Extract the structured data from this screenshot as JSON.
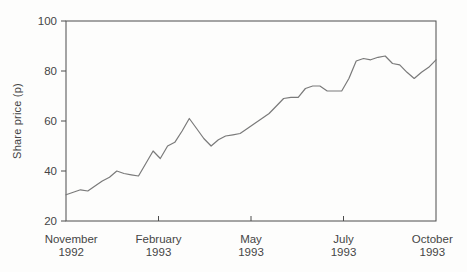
{
  "chart_data": {
    "type": "line",
    "title": "",
    "ylabel": "Share price (p)",
    "xlabel": "",
    "ylim": [
      20,
      100
    ],
    "yticks": [
      20,
      40,
      60,
      80,
      100
    ],
    "grid": false,
    "legend_position": "none",
    "xlabels": [
      {
        "month": "November",
        "year": "1992",
        "frac": 0.014,
        "tick": false
      },
      {
        "month": "February",
        "year": "1993",
        "frac": 0.25,
        "tick": true
      },
      {
        "month": "May",
        "year": "1993",
        "frac": 0.5,
        "tick": true
      },
      {
        "month": "July",
        "year": "1993",
        "frac": 0.75,
        "tick": true
      },
      {
        "month": "October",
        "year": "1993",
        "frac": 0.99,
        "tick": false
      }
    ],
    "series": [
      {
        "name": "Share price (p)",
        "values": [
          30.5,
          31.5,
          32.5,
          32,
          34,
          36,
          37.5,
          40,
          39,
          38.5,
          38,
          43,
          48,
          45,
          50,
          51.5,
          56,
          61,
          57,
          53,
          50,
          52.5,
          54,
          54.5,
          55,
          57,
          59,
          61,
          63,
          66,
          69,
          69.5,
          69.5,
          73,
          74,
          74,
          72,
          72,
          72,
          77,
          84,
          85,
          84.5,
          85.5,
          86,
          83,
          82.5,
          79.5,
          77,
          79.5,
          81.5,
          84.5
        ]
      }
    ],
    "colors": {
      "line": "#7a7a7a",
      "axis": "#4c4c4c",
      "text": "#454545",
      "background": "#fdfdfc"
    }
  }
}
